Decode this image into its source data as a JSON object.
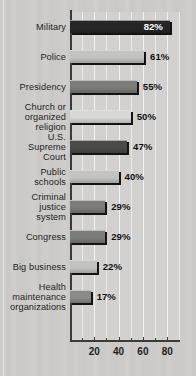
{
  "chart_data": {
    "type": "bar",
    "orientation": "horizontal",
    "title": "",
    "subtitle": "",
    "xlabel": "",
    "ylabel": "",
    "xlim": [
      0,
      90
    ],
    "grid": true,
    "legend": "none",
    "value_suffix": "%",
    "categories": [
      "Military",
      "Police",
      "Presidency",
      "Church or\norganized\nreligion",
      "U.S.\nSupreme\nCourt",
      "Public\nschools",
      "Criminal\njustice\nsystem",
      "Congress",
      "Big business",
      "Health\nmaintenance\norganizations"
    ],
    "values": [
      82,
      61,
      55,
      50,
      47,
      40,
      29,
      29,
      22,
      17
    ],
    "value_labels": [
      "82%",
      "61%",
      "55%",
      "50%",
      "47%",
      "40%",
      "29%",
      "29%",
      "22%",
      "17%"
    ],
    "bar_colors": [
      "#262626",
      "#c3c3c1",
      "#7c7c7a",
      "#d8d8d6",
      "#4a4a48",
      "#c3c3c1",
      "#7c7c7a",
      "#7c7c7a",
      "#c3c3c1",
      "#8a8a88"
    ],
    "label_inside": [
      true,
      false,
      false,
      false,
      false,
      false,
      false,
      false,
      false,
      false
    ],
    "x_major_ticks": [
      20,
      40,
      60,
      80
    ],
    "x_major_tick_labels": [
      "20",
      "40",
      "60",
      "80"
    ],
    "x_minor_ticks": [
      10,
      30,
      50,
      70
    ],
    "gridline_values": [
      10,
      20,
      30,
      40,
      50,
      60,
      70,
      80,
      90
    ]
  },
  "palette": {
    "page_background": "#cccbc9",
    "plot_background": "#d2d1cf",
    "axis": "#3b3b3a",
    "gridline": "#ffffff",
    "text": "#1d1d1d",
    "inside_label_text": "#ffffff"
  }
}
